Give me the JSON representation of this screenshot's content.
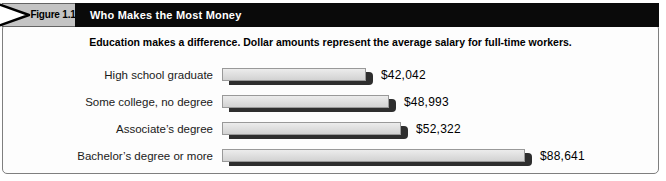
{
  "figure_header": {
    "tab_label": "Figure 1.1",
    "title": "Who Makes the Most Money"
  },
  "chart_data": {
    "type": "bar",
    "orientation": "horizontal",
    "title": "Who Makes the Most Money",
    "subtitle": "Education makes a difference. Dollar amounts represent the average salary for full-time workers.",
    "categories": [
      "High school graduate",
      "Some college, no degree",
      "Associate’s degree",
      "Bachelor’s degree or more"
    ],
    "values": [
      42042,
      48993,
      52322,
      88641
    ],
    "value_labels": [
      "$42,042",
      "$48,993",
      "$52,322",
      "$88,641"
    ],
    "xlim": [
      0,
      88641
    ],
    "bar_order": "top_to_bottom",
    "legend": "none",
    "grid": false,
    "colors": {
      "bar_fill": "#d2d2d2",
      "bar_fill_top": "#ececec",
      "bar_border": "#999999",
      "bar_shadow": "#2e2e2e",
      "header_bar_bg": "#0a0a0a",
      "header_bar_text": "#ffffff",
      "tab_bg": "#c4c4c4",
      "box_border": "#7f7f7f"
    }
  }
}
